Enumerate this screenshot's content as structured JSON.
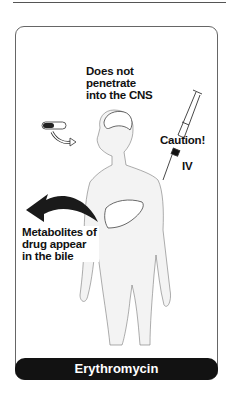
{
  "labels": {
    "cns": "Does not penetrate into the CNS",
    "cns_lines": [
      "Does not",
      "penetrate",
      "into the CNS"
    ],
    "caution": "Caution!",
    "iv": "IV",
    "bile_lines": [
      "Metabolites of",
      "drug appear",
      "in the bile"
    ]
  },
  "footer": {
    "title": "Erythromycin"
  },
  "colors": {
    "footer_bg": "#121212",
    "outline": "#666666",
    "text": "#111111"
  }
}
